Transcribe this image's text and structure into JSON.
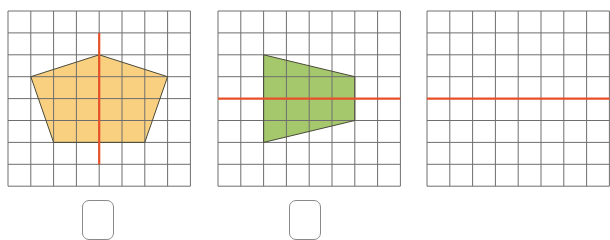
{
  "figure": {
    "grid": {
      "cols": 8,
      "rows": 8,
      "cell_w": 22.8,
      "cell_h": 21.9,
      "line_color": "#6e6e6e"
    },
    "axis_color": "#e8502a",
    "panels": [
      {
        "id": "pentagon",
        "left": 7,
        "shape": "pentagon",
        "fill": "#f9cf80",
        "points": [
          [
            4,
            2
          ],
          [
            7,
            3
          ],
          [
            6,
            6
          ],
          [
            2,
            6
          ],
          [
            1,
            3
          ]
        ],
        "axis": {
          "orientation": "vertical",
          "from": [
            4,
            1
          ],
          "to": [
            4,
            7
          ]
        }
      },
      {
        "id": "trapezoid",
        "left": 217,
        "shape": "trapezoid",
        "fill": "#a6c86c",
        "points": [
          [
            2,
            2
          ],
          [
            6,
            3
          ],
          [
            6,
            5
          ],
          [
            2,
            6
          ]
        ],
        "axis": {
          "orientation": "horizontal",
          "from": [
            0,
            4
          ],
          "to": [
            8,
            4
          ]
        }
      },
      {
        "id": "partial",
        "left": 426,
        "shape": "none",
        "fill": "",
        "points": [],
        "axis": {
          "orientation": "horizontal",
          "from": [
            0,
            4
          ],
          "to": [
            8,
            4
          ]
        }
      }
    ],
    "answer_boxes": [
      {
        "left": 82,
        "value": ""
      },
      {
        "left": 289,
        "value": ""
      }
    ]
  }
}
